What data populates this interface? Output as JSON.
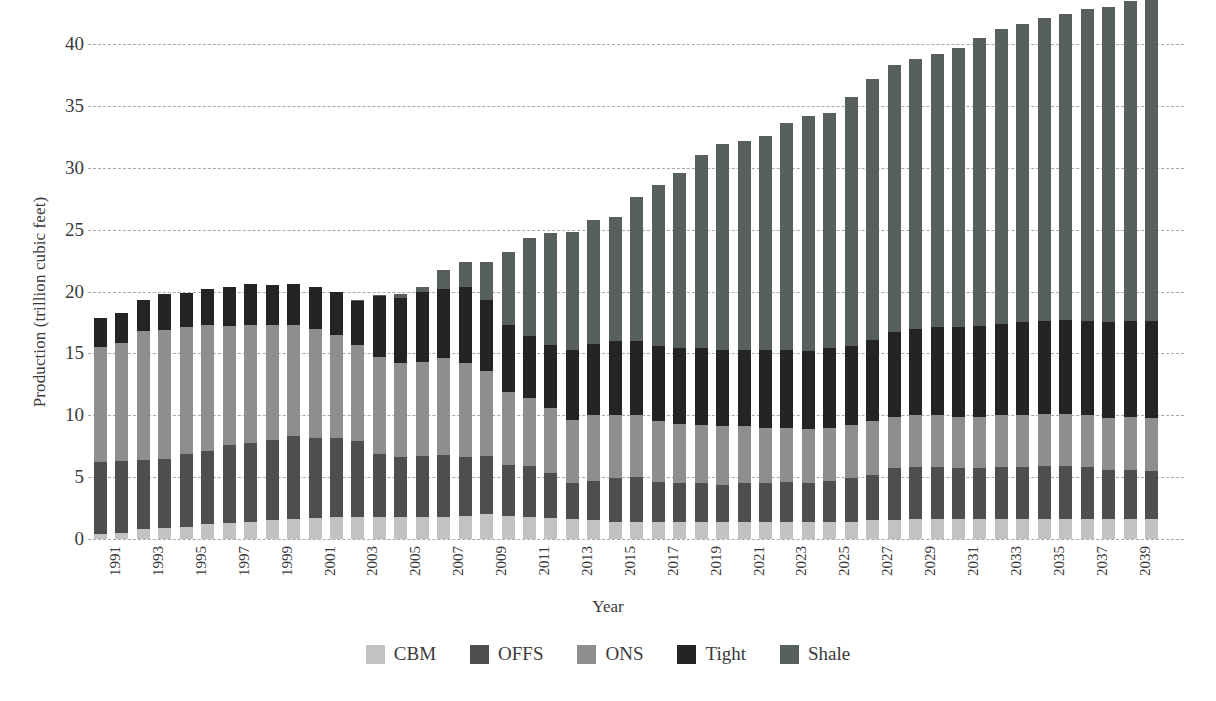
{
  "chart_data": {
    "type": "bar",
    "stacked": true,
    "title": "",
    "xlabel": "Year",
    "ylabel": "Production (trillion cubic feet)",
    "ylim": [
      0,
      40
    ],
    "ytick_values": [
      0,
      5,
      10,
      15,
      20,
      25,
      30,
      35,
      40
    ],
    "ytick_labels": [
      "0",
      "5",
      "10",
      "15",
      "20",
      "25",
      "30",
      "35",
      "40"
    ],
    "grid": "horizontal-dashed",
    "legend_position": "bottom",
    "categories": [
      1991,
      1992,
      1993,
      1994,
      1995,
      1996,
      1997,
      1998,
      1999,
      2000,
      2001,
      2002,
      2003,
      2004,
      2005,
      2006,
      2007,
      2008,
      2009,
      2010,
      2011,
      2012,
      2013,
      2014,
      2015,
      2016,
      2017,
      2018,
      2019,
      2020,
      2021,
      2022,
      2023,
      2024,
      2025,
      2026,
      2027,
      2028,
      2029,
      2030,
      2031,
      2032,
      2033,
      2034,
      2035,
      2036,
      2037,
      2038,
      2039,
      2040
    ],
    "xtick_labels": [
      "1991",
      "1993",
      "1995",
      "1997",
      "1999",
      "2001",
      "2003",
      "2005",
      "2007",
      "2009",
      "2011",
      "2013",
      "2015",
      "2017",
      "2019",
      "2021",
      "2023",
      "2025",
      "2027",
      "2029",
      "2031",
      "2033",
      "2035",
      "2037",
      "2039"
    ],
    "series": [
      {
        "name": "CBM",
        "color": "#c2c2c2",
        "values": [
          0.4,
          0.5,
          0.8,
          0.9,
          1.0,
          1.2,
          1.3,
          1.4,
          1.5,
          1.6,
          1.7,
          1.8,
          1.8,
          1.8,
          1.8,
          1.8,
          1.8,
          1.9,
          2.0,
          1.9,
          1.8,
          1.7,
          1.6,
          1.5,
          1.4,
          1.4,
          1.4,
          1.4,
          1.4,
          1.4,
          1.4,
          1.4,
          1.4,
          1.4,
          1.4,
          1.4,
          1.5,
          1.5,
          1.6,
          1.6,
          1.6,
          1.6,
          1.6,
          1.6,
          1.6,
          1.6,
          1.6,
          1.6,
          1.6,
          1.6
        ]
      },
      {
        "name": "OFFS",
        "color": "#4e4e4e",
        "values": [
          5.8,
          5.8,
          5.6,
          5.6,
          5.9,
          5.9,
          6.3,
          6.4,
          6.5,
          6.7,
          6.5,
          6.4,
          6.1,
          5.1,
          4.8,
          4.9,
          5.0,
          4.7,
          4.7,
          4.1,
          4.1,
          3.6,
          2.9,
          3.2,
          3.5,
          3.6,
          3.2,
          3.1,
          3.1,
          3.0,
          3.1,
          3.1,
          3.2,
          3.1,
          3.3,
          3.5,
          3.7,
          4.2,
          4.2,
          4.2,
          4.1,
          4.1,
          4.2,
          4.2,
          4.3,
          4.3,
          4.2,
          4.0,
          4.0,
          3.9
        ]
      },
      {
        "name": "ONS",
        "color": "#8e8e8e",
        "values": [
          9.3,
          9.5,
          10.4,
          10.4,
          10.2,
          10.2,
          9.6,
          9.5,
          9.3,
          9.0,
          8.8,
          8.3,
          7.8,
          7.8,
          7.6,
          7.6,
          7.8,
          7.6,
          6.9,
          5.9,
          5.5,
          5.3,
          5.1,
          5.3,
          5.1,
          5.0,
          4.9,
          4.8,
          4.7,
          4.7,
          4.6,
          4.5,
          4.4,
          4.4,
          4.3,
          4.3,
          4.3,
          4.2,
          4.2,
          4.2,
          4.2,
          4.2,
          4.2,
          4.2,
          4.2,
          4.2,
          4.2,
          4.2,
          4.3,
          4.3
        ]
      },
      {
        "name": "Tight",
        "color": "#242424",
        "values": [
          2.4,
          2.5,
          2.5,
          2.9,
          2.8,
          2.9,
          3.2,
          3.3,
          3.2,
          3.3,
          3.4,
          3.5,
          3.5,
          4.9,
          5.3,
          5.7,
          5.6,
          6.2,
          5.7,
          5.4,
          5.0,
          5.1,
          5.7,
          5.8,
          6.0,
          6.0,
          6.1,
          6.1,
          6.2,
          6.2,
          6.2,
          6.3,
          6.3,
          6.3,
          6.4,
          6.4,
          6.6,
          6.8,
          7.0,
          7.1,
          7.2,
          7.3,
          7.4,
          7.5,
          7.5,
          7.6,
          7.6,
          7.7,
          7.7,
          7.8
        ]
      },
      {
        "name": "Shale",
        "color": "#575f5f",
        "values": [
          0.0,
          0.0,
          0.0,
          0.0,
          0.0,
          0.0,
          0.0,
          0.0,
          0.0,
          0.0,
          0.0,
          0.0,
          0.1,
          0.1,
          0.3,
          0.4,
          1.5,
          2.0,
          3.1,
          5.9,
          7.9,
          9.0,
          9.5,
          10.0,
          10.0,
          11.6,
          13.0,
          14.2,
          15.6,
          16.6,
          16.9,
          17.3,
          18.3,
          19.0,
          19.0,
          20.1,
          21.1,
          21.6,
          21.8,
          22.1,
          22.6,
          23.3,
          23.8,
          24.1,
          24.5,
          24.7,
          25.2,
          25.5,
          25.9,
          26.0
        ]
      }
    ],
    "totals": [
      17.9,
      18.3,
      19.3,
      19.8,
      19.9,
      20.2,
      20.4,
      20.6,
      20.5,
      20.6,
      20.4,
      20.0,
      19.3,
      19.7,
      19.8,
      20.4,
      21.7,
      22.4,
      22.4,
      23.2,
      24.3,
      24.7,
      24.8,
      25.8,
      26.0,
      27.6,
      28.6,
      29.6,
      31.0,
      31.9,
      32.2,
      32.6,
      33.6,
      34.2,
      34.4,
      35.7,
      37.2,
      38.3,
      38.8,
      39.2,
      39.7,
      40.5,
      41.2,
      41.6,
      42.1,
      42.4,
      42.8,
      43.0,
      43.5,
      43.6
    ]
  },
  "legend": {
    "items": [
      {
        "label": "CBM",
        "color": "#c2c2c2"
      },
      {
        "label": "OFFS",
        "color": "#4e4e4e"
      },
      {
        "label": "ONS",
        "color": "#8e8e8e"
      },
      {
        "label": "Tight",
        "color": "#242424"
      },
      {
        "label": "Shale",
        "color": "#575f5f"
      }
    ]
  }
}
